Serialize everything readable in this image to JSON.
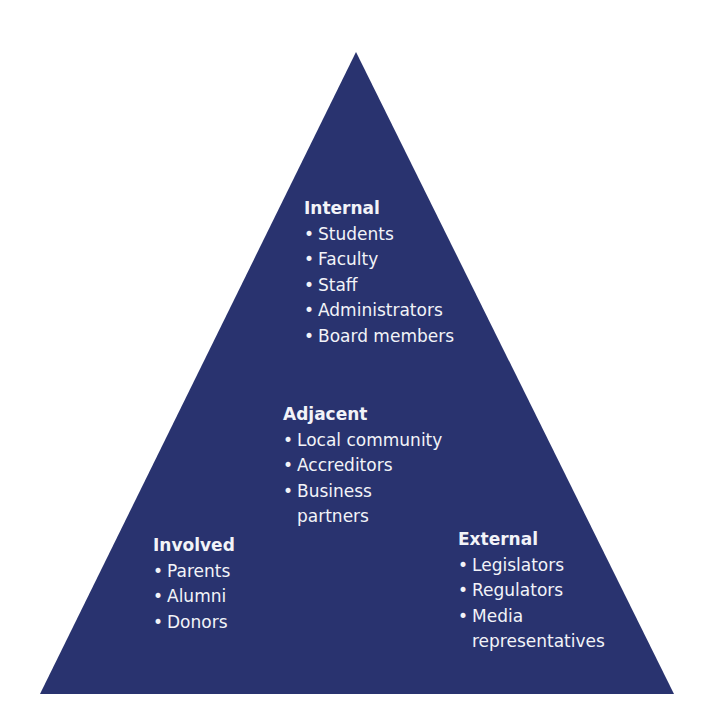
{
  "diagram": {
    "shape": "triangle",
    "fill_color": "#29336f",
    "background_color": "#ffffff",
    "text_color": "#f2f3f8",
    "vertices": {
      "apex": [
        356,
        52
      ],
      "bottom_left": [
        40,
        694
      ],
      "bottom_right": [
        674,
        694
      ]
    }
  },
  "groups": {
    "internal": {
      "title": "Internal",
      "items": [
        "Students",
        "Faculty",
        "Staff",
        "Administrators",
        "Board members"
      ]
    },
    "adjacent": {
      "title": "Adjacent",
      "items": [
        "Local community",
        "Accreditors",
        "Business partners"
      ]
    },
    "involved": {
      "title": "Involved",
      "items": [
        "Parents",
        "Alumni",
        "Donors"
      ]
    },
    "external": {
      "title": "External",
      "items": [
        "Legislators",
        "Regulators",
        "Media representatives"
      ]
    }
  }
}
